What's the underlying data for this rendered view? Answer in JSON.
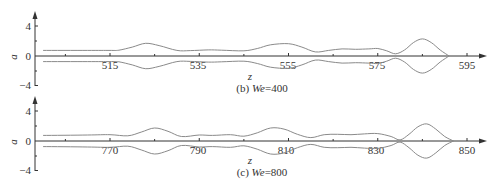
{
  "figure": {
    "line_color": "#8a8a8a",
    "axis_color": "#333333"
  },
  "chart_data": [
    {
      "type": "line",
      "title": "(b) We=400",
      "caption_prefix": "(b) ",
      "caption_var": "We",
      "caption_value": "=400",
      "xlabel": "z",
      "ylabel": "a",
      "ylim": [
        -4,
        4
      ],
      "xlim": [
        500,
        598
      ],
      "yticks": [
        4,
        0,
        -4
      ],
      "ytick_labels": [
        "4",
        "0",
        "−4"
      ],
      "xticks": [
        515,
        535,
        555,
        575,
        595
      ],
      "xtick_labels": [
        "515",
        "535",
        "555",
        "575",
        "595"
      ],
      "minor_xticks": [
        505,
        525,
        545,
        565,
        585
      ],
      "grid": false,
      "legend": null,
      "series": [
        {
          "name": "upper interface",
          "x": [
            500,
            510,
            515,
            517,
            520,
            523,
            526,
            530,
            533,
            537,
            540,
            545,
            548,
            551,
            555,
            558,
            561,
            564,
            567,
            570,
            573,
            575,
            577,
            579,
            581,
            583,
            585,
            587,
            589,
            591
          ],
          "y": [
            0.75,
            0.75,
            0.75,
            0.78,
            1.2,
            1.7,
            1.4,
            0.75,
            0.72,
            0.82,
            0.78,
            0.7,
            1.0,
            1.5,
            1.65,
            1.2,
            0.55,
            0.75,
            0.95,
            0.9,
            0.95,
            1.0,
            0.7,
            0.3,
            0.8,
            1.8,
            2.3,
            1.8,
            0.8,
            0.0
          ]
        },
        {
          "name": "lower interface",
          "x": [
            500,
            510,
            515,
            517,
            520,
            523,
            526,
            530,
            533,
            537,
            540,
            545,
            548,
            551,
            555,
            558,
            561,
            564,
            567,
            570,
            573,
            575,
            577,
            579,
            581,
            583,
            585,
            587,
            589,
            591
          ],
          "y": [
            -0.75,
            -0.75,
            -0.75,
            -0.78,
            -1.2,
            -1.7,
            -1.4,
            -0.75,
            -0.72,
            -0.82,
            -0.78,
            -0.7,
            -1.0,
            -1.5,
            -1.65,
            -1.2,
            -0.55,
            -0.75,
            -0.95,
            -0.9,
            -0.95,
            -1.0,
            -0.7,
            -0.3,
            -0.8,
            -1.8,
            -2.3,
            -1.8,
            -0.8,
            0.0
          ]
        }
      ]
    },
    {
      "type": "line",
      "title": "(c) We=800",
      "caption_prefix": "(c) ",
      "caption_var": "We",
      "caption_value": "=800",
      "xlabel": "z",
      "ylabel": "a",
      "ylim": [
        -4,
        4
      ],
      "xlim": [
        755,
        853
      ],
      "yticks": [
        4,
        0,
        -4
      ],
      "ytick_labels": [
        "4",
        "0",
        "−4"
      ],
      "xticks": [
        770,
        790,
        810,
        830,
        850
      ],
      "xtick_labels": [
        "770",
        "790",
        "810",
        "830",
        "850"
      ],
      "minor_xticks": [
        760,
        780,
        800,
        820,
        840
      ],
      "grid": false,
      "legend": null,
      "series": [
        {
          "name": "upper interface",
          "x": [
            755,
            765,
            770,
            774,
            777,
            780,
            783,
            786,
            790,
            793,
            797,
            800,
            803,
            806,
            809,
            812,
            815,
            818,
            821,
            824,
            827,
            830,
            833,
            835,
            837,
            839,
            841,
            843,
            845,
            847
          ],
          "y": [
            0.75,
            0.8,
            0.85,
            0.7,
            1.2,
            1.75,
            1.3,
            0.6,
            0.8,
            0.75,
            0.85,
            0.65,
            1.1,
            1.75,
            1.6,
            0.9,
            0.45,
            0.85,
            0.9,
            0.85,
            0.95,
            1.0,
            0.6,
            0.15,
            0.9,
            1.9,
            2.3,
            1.6,
            0.6,
            0.0
          ]
        },
        {
          "name": "lower interface",
          "x": [
            755,
            765,
            770,
            774,
            777,
            780,
            783,
            786,
            790,
            793,
            797,
            800,
            803,
            806,
            809,
            812,
            815,
            818,
            821,
            824,
            827,
            830,
            833,
            835,
            837,
            839,
            841,
            843,
            845,
            847
          ],
          "y": [
            -0.75,
            -0.8,
            -0.85,
            -0.7,
            -1.2,
            -1.75,
            -1.3,
            -0.6,
            -0.8,
            -0.75,
            -0.85,
            -0.65,
            -1.1,
            -1.75,
            -1.6,
            -0.9,
            -0.45,
            -0.85,
            -0.9,
            -0.85,
            -0.95,
            -1.0,
            -0.6,
            -0.15,
            -0.9,
            -1.9,
            -2.3,
            -1.6,
            -0.6,
            0.0
          ]
        }
      ]
    }
  ],
  "panels": [
    {
      "caption_prefix": "(b) ",
      "caption_var": "We",
      "caption_value": "=400",
      "xlabel": "z",
      "ylabel": "a",
      "ytick_labels": [
        "4",
        "0",
        "−4"
      ],
      "xtick_labels": [
        "515",
        "535",
        "555",
        "575",
        "595"
      ]
    },
    {
      "caption_prefix": "(c) ",
      "caption_var": "We",
      "caption_value": "=800",
      "xlabel": "z",
      "ylabel": "a",
      "ytick_labels": [
        "4",
        "0",
        "−4"
      ],
      "xtick_labels": [
        "770",
        "790",
        "810",
        "830",
        "850"
      ]
    }
  ]
}
